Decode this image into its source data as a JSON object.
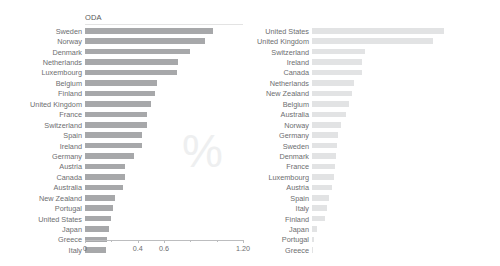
{
  "chart_data": [
    {
      "type": "bar",
      "title": "ODA",
      "orientation": "horizontal",
      "xlabel": "",
      "ylabel": "",
      "xlim": [
        0,
        1.2
      ],
      "grid": false,
      "legend": null,
      "tick_labels": [
        "0",
        "0.4",
        "0.6",
        "1.20"
      ],
      "tick_values": [
        0,
        0.4,
        0.6,
        1.2
      ],
      "minor_ticks": [
        0.2,
        0.8,
        1.0
      ],
      "bar_color": "#a7a8aa",
      "watermark": "%",
      "categories": [
        "Sweden",
        "Norway",
        "Denmark",
        "Netherlands",
        "Luxembourg",
        "Belgium",
        "Finland",
        "United Kingdom",
        "France",
        "Switzerland",
        "Spain",
        "Ireland",
        "Germany",
        "Austria",
        "Canada",
        "Australia",
        "New Zealand",
        "Portugal",
        "United States",
        "Japan",
        "Greece",
        "Italy"
      ],
      "values": [
        0.97,
        0.91,
        0.8,
        0.71,
        0.7,
        0.55,
        0.53,
        0.5,
        0.47,
        0.47,
        0.43,
        0.43,
        0.37,
        0.3,
        0.3,
        0.29,
        0.23,
        0.21,
        0.2,
        0.18,
        0.17,
        0.16
      ]
    },
    {
      "type": "bar",
      "title": "Philanthropy*",
      "orientation": "horizontal",
      "xlabel": "",
      "ylabel": "",
      "xlim": [
        0,
        0.3
      ],
      "grid": false,
      "legend": null,
      "tick_labels": [
        "0",
        "0.1",
        "0.2",
        "0.3"
      ],
      "tick_values": [
        0,
        0.1,
        0.2,
        0.3
      ],
      "minor_ticks": [
        0.05,
        0.15,
        0.25
      ],
      "bar_color": "#e2e3e4",
      "watermark": "%",
      "categories": [
        "United States",
        "United Kingdom",
        "Switzerland",
        "Ireland",
        "Canada",
        "Netherlands",
        "New Zealand",
        "Belgium",
        "Australia",
        "Norway",
        "Germany",
        "Sweden",
        "Denmark",
        "France",
        "Luxembourg",
        "Austria",
        "Spain",
        "Italy",
        "Finland",
        "Japan",
        "Portugal",
        "Greece"
      ],
      "values": [
        0.25,
        0.23,
        0.1,
        0.095,
        0.095,
        0.08,
        0.075,
        0.07,
        0.065,
        0.055,
        0.05,
        0.048,
        0.046,
        0.044,
        0.042,
        0.038,
        0.032,
        0.028,
        0.024,
        0.01,
        0.004,
        0.001
      ]
    }
  ]
}
